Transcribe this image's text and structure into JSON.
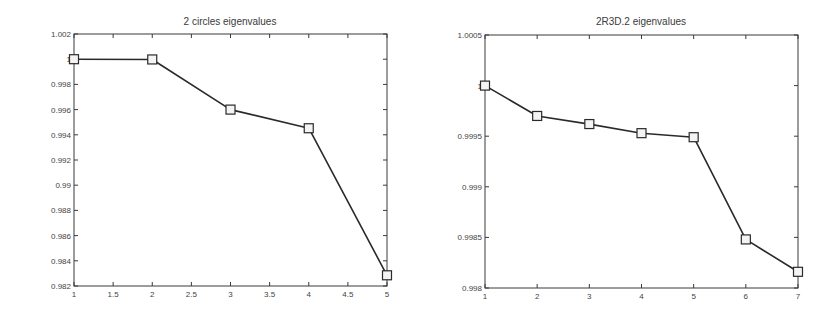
{
  "chart_data": [
    {
      "type": "line",
      "title": "2 circles eigenvalues",
      "xlabel": "",
      "ylabel": "",
      "x": [
        1,
        2,
        3,
        4,
        5
      ],
      "series": [
        {
          "name": "eigenvalues",
          "marker": "square",
          "values": [
            1.0,
            0.99998,
            0.996,
            0.99452,
            0.98285
          ]
        }
      ],
      "xlim": [
        1,
        5
      ],
      "ylim": [
        0.982,
        1.002
      ],
      "xticks": [
        "1",
        "1.5",
        "2",
        "2.5",
        "3",
        "3.5",
        "4",
        "4.5",
        "5"
      ],
      "xtick_values": [
        1,
        1.5,
        2,
        2.5,
        3,
        3.5,
        4,
        4.5,
        5
      ],
      "yticks": [
        "0.982",
        "0.984",
        "0.986",
        "0.988",
        "0.99",
        "0.992",
        "0.994",
        "0.996",
        "0.998",
        "1",
        "1.002"
      ],
      "ytick_values": [
        0.982,
        0.984,
        0.986,
        0.988,
        0.99,
        0.992,
        0.994,
        0.996,
        0.998,
        1.0,
        1.002
      ],
      "grid": false,
      "legend": null,
      "plot_box": {
        "x0": 74,
        "y0": 34,
        "x1": 387,
        "y1": 286
      }
    },
    {
      "type": "line",
      "title": "2R3D.2 eigenvalues",
      "xlabel": "",
      "ylabel": "",
      "x": [
        1,
        2,
        3,
        4,
        5,
        6,
        7
      ],
      "series": [
        {
          "name": "eigenvalues",
          "marker": "square",
          "values": [
            1.0,
            0.9997,
            0.99962,
            0.99953,
            0.99949,
            0.99848,
            0.99816
          ]
        }
      ],
      "xlim": [
        1,
        7
      ],
      "ylim": [
        0.998,
        1.0005
      ],
      "xticks": [
        "1",
        "2",
        "3",
        "4",
        "5",
        "6",
        "7"
      ],
      "xtick_values": [
        1,
        2,
        3,
        4,
        5,
        6,
        7
      ],
      "yticks": [
        "0.998",
        "0.9985",
        "0.999",
        "0.9995",
        "1",
        "1.0005"
      ],
      "ytick_values": [
        0.998,
        0.9985,
        0.999,
        0.9995,
        1.0,
        1.0005
      ],
      "grid": false,
      "legend": null,
      "plot_box": {
        "x0": 485,
        "y0": 35,
        "x1": 798,
        "y1": 288
      }
    }
  ]
}
